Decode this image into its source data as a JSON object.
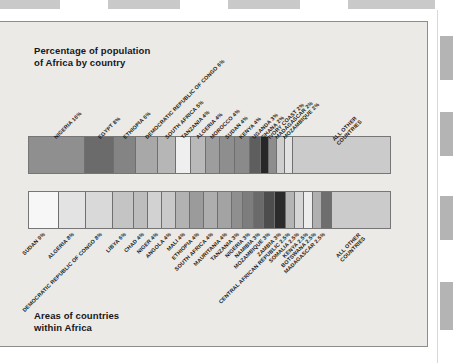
{
  "page": {
    "caption_top": "Percentage of population\nof Africa by country",
    "caption_bottom": "Areas of countries\nwithin Africa",
    "background_color": "#eceae7",
    "border_color": "#8d8d8d"
  },
  "chart_data": [
    {
      "type": "bar",
      "orientation": "horizontal-stacked",
      "title": "Percentage of population of Africa by country",
      "xlabel": "",
      "ylabel": "",
      "unit": "percent",
      "grid": false,
      "legend": "none",
      "categories": [
        "NIGERIA",
        "EGYPT",
        "ETHIOPIA",
        "DEMOCRATIC REPUBLIC OF CONGO",
        "SOUTH AFRICA",
        "TANZANIA",
        "ALGERIA",
        "MOROCCO",
        "SUDAN",
        "KENYA",
        "UGANDA",
        "GHANA",
        "IVORY COAST",
        "MADAGASCAR",
        "MOZAMBIQUE",
        "ALL OTHER COUNTRIES"
      ],
      "values": [
        16,
        8,
        6,
        6,
        5,
        4,
        4,
        4,
        4,
        4,
        3,
        2,
        2,
        2,
        2,
        28
      ],
      "tick_labels": [
        "NIGERIA 16%",
        "EGYPT 8%",
        "ETHIOPIA 6%",
        "DEMOCRATIC REPUBLIC OF CONGO 6%",
        "SOUTH AFRICA 5%",
        "TANZANIA 4%",
        "ALGERIA 4%",
        "MOROCCO 4%",
        "SUDAN 4%",
        "KENYA 4%",
        "UGANDA 3%",
        "GHANA 2%",
        "IVORY COAST 2%",
        "MADAGASCAR 2%",
        "MOZAMBIQUE 2%",
        "ALL OTHER COUNTRIES"
      ],
      "colors": [
        "#8f8f8f",
        "#6b6b6b",
        "#848484",
        "#a8a8a8",
        "#b6b6b6",
        "#efefef",
        "#b9b9b9",
        "#9d9d9d",
        "#8e8e8e",
        "#8a8a8a",
        "#5e5e5e",
        "#272727",
        "#8d8d8d",
        "#cfcfcf",
        "#e2e2e2",
        "#cbcbcb"
      ]
    },
    {
      "type": "bar",
      "orientation": "horizontal-stacked",
      "title": "Areas of countries within Africa",
      "xlabel": "",
      "ylabel": "",
      "unit": "percent",
      "grid": false,
      "legend": "none",
      "categories": [
        "SUDAN",
        "ALGERIA",
        "DEMOCRATIC REPUBLIC OF CONGO",
        "LIBYA",
        "CHAD",
        "NIGER",
        "ANGOLA",
        "MALI",
        "ETHIOPIA",
        "SOUTH AFRICA",
        "MAURITANIA",
        "TANZANIA",
        "NIGERIA",
        "NAMIBIA",
        "MOZAMBIQUE",
        "ZAMBIA",
        "CENTRAL AFRICAN REPUBLIC",
        "SOMALIA",
        "KENYA",
        "BOTSWANA",
        "MADAGASCAR",
        "ALL OTHER COUNTRIES"
      ],
      "values": [
        9,
        8,
        8,
        6,
        4,
        4,
        4,
        4,
        4,
        4,
        4,
        3,
        3,
        3,
        3,
        3,
        2.5,
        2.5,
        2.5,
        2.5,
        2.5,
        18
      ],
      "tick_labels": [
        "SUDAN 9%",
        "ALGERIA 8%",
        "DEMOCRATIC REPUBLIC OF CONGO 8%",
        "LIBYA 6%",
        "CHAD 4%",
        "NIGER 4%",
        "ANGOLA 4%",
        "MALI 4%",
        "ETHIOPIA 4%",
        "SOUTH AFRICA 4%",
        "MAURITANIA 4%",
        "TANZANIA 3%",
        "NIGERIA 3%",
        "NAMIBIA 3%",
        "MOZAMBIQUE 3%",
        "ZAMBIA 3%",
        "CENTRAL AFRICAN REPUBLIC 2.5%",
        "SOMALIA 2.5%",
        "KENYA 2.5%",
        "BOTSWANA 2.5%",
        "MADAGASCAR 2.5%",
        "ALL OTHER COUNTRIES"
      ],
      "colors": [
        "#f7f7f7",
        "#e3e3e3",
        "#d9d9d9",
        "#c4c4c4",
        "#bdbdbd",
        "#d2d2d2",
        "#c9c9c9",
        "#b2b2b2",
        "#9b9b9b",
        "#aeaeae",
        "#a3a3a3",
        "#8f8f8f",
        "#7d7d7d",
        "#6a6a6a",
        "#4d4d4d",
        "#2b2b2b",
        "#b5b5b5",
        "#d6d6d6",
        "#ededed",
        "#b0b0b0",
        "#6e6e6e",
        "#cbcbcb"
      ]
    }
  ]
}
